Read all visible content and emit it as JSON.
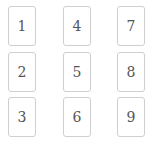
{
  "grid": {
    "cards": [
      {
        "label": "1",
        "x": 8,
        "y": 6
      },
      {
        "label": "2",
        "x": 8,
        "y": 52
      },
      {
        "label": "3",
        "x": 8,
        "y": 97
      },
      {
        "label": "4",
        "x": 63,
        "y": 6
      },
      {
        "label": "5",
        "x": 63,
        "y": 52
      },
      {
        "label": "6",
        "x": 63,
        "y": 97
      },
      {
        "label": "7",
        "x": 117,
        "y": 6
      },
      {
        "label": "8",
        "x": 117,
        "y": 52
      },
      {
        "label": "9",
        "x": 117,
        "y": 97
      }
    ]
  },
  "colors": {
    "border": "#cfcfcf",
    "text": "#555555",
    "background": "#ffffff"
  }
}
